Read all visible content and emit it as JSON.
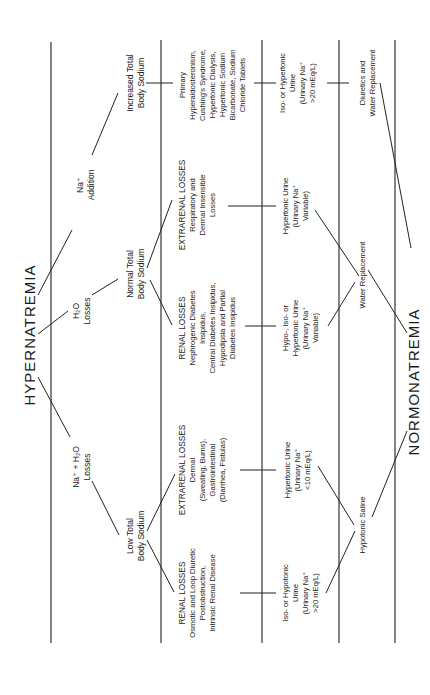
{
  "diagram": {
    "orientation": "rotated 90° counter-clockwise",
    "top_title": "HYPERNATREMIA",
    "bottom_title": "NORMONATREMIA",
    "mechanisms": {
      "na_h2o_losses": [
        "Na⁺ + H₂O",
        "Losses"
      ],
      "h2o_losses": [
        "H₂O",
        "Losses"
      ],
      "na_addition": [
        "Na⁺",
        "Addition"
      ]
    },
    "body_sodium": {
      "low": [
        "Low Total",
        "Body Sodium"
      ],
      "normal": [
        "Normal Total",
        "Body Sodium"
      ],
      "increased": [
        "Increased Total",
        "Body Sodium"
      ]
    },
    "causes": {
      "low_renal": [
        "RENAL LOSSES",
        "Osmotic and Loop Diuretic",
        "Postobstruction,",
        "Intrinsic Renal Disease"
      ],
      "low_extrarenal": [
        "EXTRARENAL LOSSES",
        "Dermal",
        "(Sweating, Burns),",
        "Gastrointestinal",
        "(Diarrhea, Fistulas)"
      ],
      "normal_renal": [
        "RENAL LOSSES",
        "Nephrogenic Diabetes",
        "Insipidus,",
        "Central Diabetes Insipidus,",
        "Hypodipsia and Partial",
        "Diabetes Insipidus"
      ],
      "normal_extrarenal": [
        "EXTRARENAL LOSSES",
        "Respiratory and",
        "Dermal Insensible",
        "Losses"
      ],
      "increased": [
        "Primary",
        "Hyperaldosteronism,",
        "Cushing's Syndrome,",
        "Hypertonic Dialysis,",
        "Hypertonic Sodium",
        "Bicarbonate, Sodium",
        "Chloride Tablets"
      ]
    },
    "urine": {
      "low_renal": [
        "Iso- or Hypotonic",
        "Urine",
        "(Urinary Na⁺",
        ">20 mEq/L)"
      ],
      "low_extrarenal": [
        "Hypertonic Urine",
        "(Urinary Na⁺",
        "<10 mEq/L)"
      ],
      "normal_renal": [
        "Hypo-, Iso- or",
        "Hypertonic Urine",
        "(Urinary Na⁺",
        "Variable)"
      ],
      "normal_extrarenal": [
        "Hypertonic Urine",
        "(Urinary Na⁺",
        "Variable)"
      ],
      "increased": [
        "Iso- or Hypertonic",
        "Urine",
        "(Urinary Na⁺",
        ">20 mEq/L)"
      ]
    },
    "treatment": {
      "low": [
        "Hypotonic Saline"
      ],
      "normal": [
        "Water Replacement"
      ],
      "increased": [
        "Diuretics and",
        "Water Replacement"
      ]
    }
  }
}
